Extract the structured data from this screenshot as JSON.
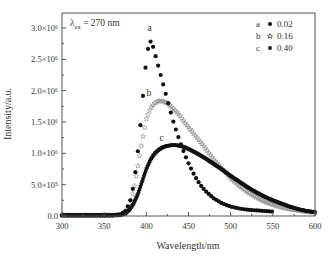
{
  "chart_data": {
    "type": "scatter",
    "title": "",
    "annotation": "λex = 270 nm",
    "annotation_main": "λ",
    "annotation_sub": "ex",
    "annotation_rest": " = 270 nm",
    "xlabel": "Wavelength/nm",
    "ylabel": "Intensity/a.u.",
    "xlim": [
      300,
      600
    ],
    "ylim": [
      0,
      3.2
    ],
    "y_unit_multiplier": 1000000,
    "x_ticks": [
      300,
      350,
      400,
      450,
      500,
      550,
      600
    ],
    "x_tick_labels": [
      "300",
      "350",
      "400",
      "450",
      "500",
      "550",
      "600"
    ],
    "y_ticks": [
      0,
      0.5,
      1.0,
      1.5,
      2.0,
      2.5,
      3.0
    ],
    "y_tick_labels": [
      "0.0",
      "5.0×10⁵",
      "1.0×10⁶",
      "1.5×10⁶",
      "2.0×10⁶",
      "2.5×10⁶",
      "3.0×10⁶"
    ],
    "grid": false,
    "legend_position": "upper right",
    "legend": [
      {
        "key": "a",
        "marker": "●",
        "value": "0.02"
      },
      {
        "key": "b",
        "marker": "☆",
        "value": "0.16"
      },
      {
        "key": "c",
        "marker": "■",
        "value": "0.40"
      }
    ],
    "series": [
      {
        "name": "a (0.02)",
        "label": "a",
        "marker": "circle-filled",
        "label_pos": [
          404,
          2.95
        ],
        "x": [
          300,
          320,
          340,
          360,
          370,
          375,
          380,
          383,
          386,
          389,
          392,
          395,
          398,
          401,
          404,
          407,
          410,
          413,
          416,
          419,
          422,
          425,
          428,
          431,
          434,
          437,
          440,
          445,
          450,
          455,
          460,
          465,
          470,
          480,
          490,
          500,
          510,
          520,
          530,
          540,
          550
        ],
        "y": [
          0.01,
          0.01,
          0.01,
          0.01,
          0.03,
          0.08,
          0.2,
          0.35,
          0.6,
          0.9,
          1.3,
          1.75,
          2.25,
          2.6,
          2.8,
          2.75,
          2.6,
          2.45,
          2.3,
          2.15,
          2.0,
          1.85,
          1.7,
          1.55,
          1.42,
          1.3,
          1.18,
          1.0,
          0.84,
          0.7,
          0.58,
          0.48,
          0.4,
          0.28,
          0.2,
          0.15,
          0.12,
          0.1,
          0.09,
          0.08,
          0.07
        ]
      },
      {
        "name": "b (0.16)",
        "label": "b",
        "marker": "star-open",
        "label_pos": [
          403,
          1.92
        ],
        "x": [
          300,
          320,
          340,
          360,
          370,
          375,
          380,
          385,
          390,
          395,
          400,
          405,
          410,
          415,
          420,
          425,
          430,
          435,
          440,
          445,
          450,
          460,
          470,
          480,
          490,
          500,
          510,
          520,
          530,
          540,
          550,
          560,
          570,
          580,
          590,
          600
        ],
        "y": [
          0.01,
          0.01,
          0.01,
          0.01,
          0.02,
          0.05,
          0.15,
          0.4,
          0.8,
          1.2,
          1.55,
          1.72,
          1.8,
          1.84,
          1.83,
          1.8,
          1.74,
          1.67,
          1.6,
          1.5,
          1.42,
          1.25,
          1.08,
          0.9,
          0.75,
          0.6,
          0.48,
          0.38,
          0.3,
          0.23,
          0.18,
          0.14,
          0.11,
          0.09,
          0.07,
          0.06
        ]
      },
      {
        "name": "c (0.40)",
        "label": "c",
        "marker": "square-filled",
        "label_pos": [
          418,
          1.2
        ],
        "x": [
          300,
          320,
          340,
          360,
          370,
          375,
          380,
          385,
          390,
          395,
          400,
          405,
          410,
          415,
          420,
          425,
          430,
          435,
          440,
          445,
          450,
          460,
          470,
          480,
          490,
          500,
          510,
          520,
          530,
          540,
          550,
          560,
          570,
          580,
          590,
          600
        ],
        "y": [
          0.01,
          0.01,
          0.01,
          0.01,
          0.02,
          0.04,
          0.1,
          0.2,
          0.35,
          0.55,
          0.75,
          0.9,
          1.0,
          1.06,
          1.1,
          1.12,
          1.13,
          1.13,
          1.12,
          1.1,
          1.07,
          1.0,
          0.92,
          0.83,
          0.74,
          0.64,
          0.55,
          0.46,
          0.38,
          0.31,
          0.25,
          0.2,
          0.15,
          0.11,
          0.08,
          0.06
        ]
      }
    ]
  }
}
